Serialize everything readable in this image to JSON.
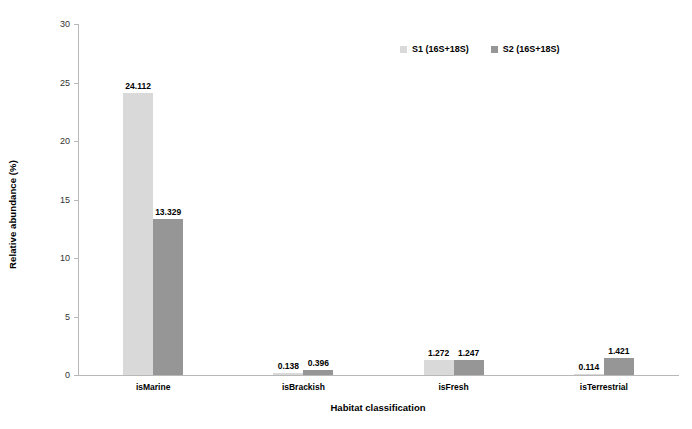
{
  "chart_data": {
    "type": "bar",
    "title": "",
    "xlabel": "Habitat classification",
    "ylabel": "Relative abundance (%)",
    "ylim": [
      0,
      30
    ],
    "yticks": [
      0,
      5,
      10,
      15,
      20,
      25,
      30
    ],
    "ytick_labels": [
      "0",
      "5",
      "10",
      "15",
      "20",
      "25",
      "30"
    ],
    "grid": false,
    "legend_position": "top-right",
    "categories": [
      "isMarine",
      "isBrackish",
      "isFresh",
      "isTerrestrial"
    ],
    "series": [
      {
        "name": "S1 (16S+18S)",
        "color": "#d9d9d9",
        "values": [
          24.112,
          0.138,
          1.272,
          0.114
        ],
        "value_labels": [
          "24.112",
          "0.138",
          "1.272",
          "0.114"
        ]
      },
      {
        "name": "S2 (16S+18S)",
        "color": "#969696",
        "values": [
          13.329,
          0.396,
          1.247,
          1.421
        ],
        "value_labels": [
          "13.329",
          "0.396",
          "1.247",
          "1.421"
        ]
      }
    ]
  },
  "legend": {
    "items": [
      {
        "label": "S1 (16S+18S)",
        "color": "#d9d9d9"
      },
      {
        "label": "S2 (16S+18S)",
        "color": "#969696"
      }
    ]
  },
  "axes": {
    "y_title": "Relative abundance (%)",
    "x_title": "Habitat classification"
  }
}
